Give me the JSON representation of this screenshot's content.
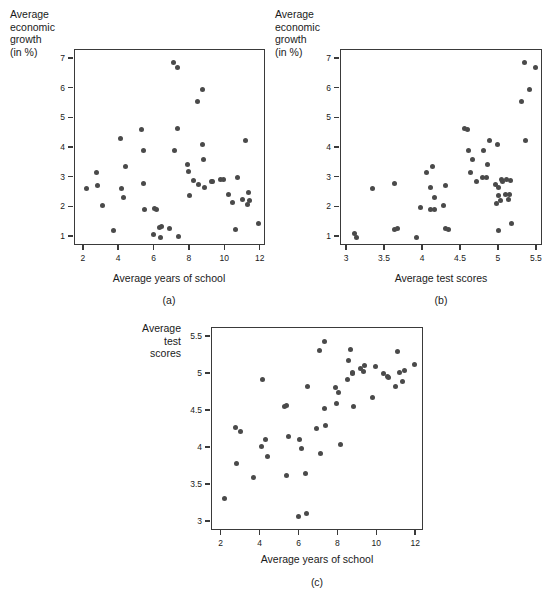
{
  "figure": {
    "panels": [
      {
        "id": "a",
        "caption": "(a)",
        "ylabel_lines": [
          "Average",
          "economic",
          "growth",
          "(in %)"
        ],
        "xlabel": "Average years of school",
        "xticks": [
          "2",
          "4",
          "6",
          "8",
          "10",
          "12"
        ],
        "yticks": [
          "1",
          "2",
          "3",
          "4",
          "5",
          "6",
          "7"
        ]
      },
      {
        "id": "b",
        "caption": "(b)",
        "ylabel_lines": [
          "Average",
          "economic",
          "growth",
          "(in %)"
        ],
        "xlabel": "Average test scores",
        "xticks": [
          "3",
          "3.5",
          "4",
          "4.5",
          "5",
          "5.5"
        ],
        "yticks": [
          "1",
          "2",
          "3",
          "4",
          "5",
          "6",
          "7"
        ]
      },
      {
        "id": "c",
        "caption": "(c)",
        "ylabel_lines": [
          "Average",
          "test",
          "scores"
        ],
        "xlabel": "Average years of school",
        "xticks": [
          "2",
          "4",
          "6",
          "8",
          "10",
          "12"
        ],
        "yticks": [
          "3",
          "3.5",
          "4",
          "4.5",
          "5",
          "5.5"
        ]
      }
    ],
    "marker_color": "#4a4a4a",
    "frame_color": "#3a3a3a"
  },
  "chart_data": [
    {
      "type": "scatter",
      "panel": "a",
      "title": "",
      "xlabel": "Average years of school",
      "ylabel": "Average economic growth (in %)",
      "xlim": [
        1.5,
        12.3
      ],
      "ylim": [
        0.7,
        7.3
      ],
      "xticks": [
        2,
        4,
        6,
        8,
        10,
        12
      ],
      "yticks": [
        1,
        2,
        3,
        4,
        5,
        6,
        7
      ],
      "grid": false,
      "legend": "none",
      "points": [
        [
          2.15,
          2.62
        ],
        [
          2.7,
          3.18
        ],
        [
          2.8,
          2.75
        ],
        [
          3.05,
          2.08
        ],
        [
          3.65,
          1.22
        ],
        [
          4.1,
          4.33
        ],
        [
          4.15,
          2.63
        ],
        [
          4.25,
          2.35
        ],
        [
          4.35,
          3.38
        ],
        [
          5.25,
          4.63
        ],
        [
          5.35,
          3.92
        ],
        [
          5.4,
          2.8
        ],
        [
          5.45,
          1.92
        ],
        [
          5.95,
          1.08
        ],
        [
          6.0,
          1.97
        ],
        [
          6.1,
          1.94
        ],
        [
          6.3,
          1.33
        ],
        [
          6.35,
          0.98
        ],
        [
          6.4,
          1.35
        ],
        [
          6.85,
          1.28
        ],
        [
          7.05,
          6.88
        ],
        [
          7.1,
          3.9
        ],
        [
          7.3,
          6.7
        ],
        [
          7.3,
          4.67
        ],
        [
          7.35,
          1.02
        ],
        [
          7.85,
          3.44
        ],
        [
          7.9,
          3.2
        ],
        [
          8.0,
          2.4
        ],
        [
          8.2,
          2.92
        ],
        [
          8.45,
          5.58
        ],
        [
          8.5,
          2.78
        ],
        [
          8.7,
          5.96
        ],
        [
          8.7,
          4.13
        ],
        [
          8.75,
          3.6
        ],
        [
          8.8,
          2.66
        ],
        [
          9.2,
          2.88
        ],
        [
          9.3,
          2.87
        ],
        [
          9.75,
          2.94
        ],
        [
          9.9,
          2.93
        ],
        [
          10.2,
          2.45
        ],
        [
          10.4,
          2.16
        ],
        [
          10.6,
          1.24
        ],
        [
          10.7,
          3.02
        ],
        [
          10.95,
          2.27
        ],
        [
          11.15,
          4.25
        ],
        [
          11.25,
          2.1
        ],
        [
          11.3,
          2.5
        ],
        [
          11.35,
          2.22
        ],
        [
          11.9,
          1.45
        ]
      ]
    },
    {
      "type": "scatter",
      "panel": "b",
      "title": "",
      "xlabel": "Average test scores",
      "ylabel": "Average economic growth (in %)",
      "xlim": [
        2.92,
        5.58
      ],
      "ylim": [
        0.7,
        7.3
      ],
      "xticks": [
        3,
        3.5,
        4,
        4.5,
        5,
        5.5
      ],
      "yticks": [
        1,
        2,
        3,
        4,
        5,
        6,
        7
      ],
      "grid": false,
      "legend": "none",
      "points": [
        [
          3.1,
          1.12
        ],
        [
          3.12,
          0.98
        ],
        [
          3.33,
          2.62
        ],
        [
          3.63,
          2.79
        ],
        [
          3.62,
          1.24
        ],
        [
          3.66,
          1.3
        ],
        [
          3.92,
          1.0
        ],
        [
          3.97,
          2.0
        ],
        [
          4.05,
          3.18
        ],
        [
          4.1,
          2.66
        ],
        [
          4.1,
          1.93
        ],
        [
          4.13,
          3.38
        ],
        [
          4.15,
          1.92
        ],
        [
          4.15,
          2.35
        ],
        [
          4.27,
          2.08
        ],
        [
          4.3,
          2.75
        ],
        [
          4.3,
          1.3
        ],
        [
          4.33,
          1.24
        ],
        [
          4.55,
          4.65
        ],
        [
          4.58,
          4.62
        ],
        [
          4.6,
          3.92
        ],
        [
          4.62,
          3.18
        ],
        [
          4.65,
          3.6
        ],
        [
          4.7,
          2.88
        ],
        [
          4.78,
          3.0
        ],
        [
          4.8,
          3.9
        ],
        [
          4.83,
          3.02
        ],
        [
          4.85,
          3.44
        ],
        [
          4.88,
          4.25
        ],
        [
          4.95,
          2.78
        ],
        [
          4.97,
          2.14
        ],
        [
          4.98,
          4.13
        ],
        [
          5.0,
          2.66
        ],
        [
          5.0,
          2.4
        ],
        [
          5.0,
          1.22
        ],
        [
          5.02,
          2.22
        ],
        [
          5.03,
          2.94
        ],
        [
          5.05,
          2.86
        ],
        [
          5.08,
          2.44
        ],
        [
          5.1,
          2.93
        ],
        [
          5.12,
          2.27
        ],
        [
          5.14,
          2.45
        ],
        [
          5.15,
          2.92
        ],
        [
          5.16,
          1.45
        ],
        [
          5.33,
          6.88
        ],
        [
          5.35,
          4.25
        ],
        [
          5.3,
          5.58
        ],
        [
          5.4,
          5.96
        ],
        [
          5.48,
          6.7
        ]
      ]
    },
    {
      "type": "scatter",
      "panel": "c",
      "title": "",
      "xlabel": "Average years of school",
      "ylabel": "Average test scores",
      "xlim": [
        1.5,
        12.4
      ],
      "ylim": [
        2.88,
        5.62
      ],
      "xticks": [
        2,
        4,
        6,
        8,
        10,
        12
      ],
      "yticks": [
        3,
        3.5,
        4,
        4.5,
        5,
        5.5
      ],
      "grid": false,
      "legend": "none",
      "points": [
        [
          2.15,
          3.32
        ],
        [
          2.7,
          4.28
        ],
        [
          2.75,
          3.79
        ],
        [
          2.95,
          4.22
        ],
        [
          3.65,
          3.6
        ],
        [
          4.05,
          4.02
        ],
        [
          4.1,
          4.93
        ],
        [
          4.25,
          4.12
        ],
        [
          4.35,
          3.88
        ],
        [
          5.25,
          4.56
        ],
        [
          5.32,
          4.57
        ],
        [
          5.35,
          3.63
        ],
        [
          5.45,
          4.15
        ],
        [
          5.95,
          3.08
        ],
        [
          6.0,
          4.11
        ],
        [
          6.1,
          4.0
        ],
        [
          6.3,
          3.65
        ],
        [
          6.35,
          3.12
        ],
        [
          6.4,
          4.83
        ],
        [
          6.85,
          4.26
        ],
        [
          7.05,
          5.32
        ],
        [
          7.1,
          3.92
        ],
        [
          7.3,
          5.44
        ],
        [
          7.3,
          4.54
        ],
        [
          7.35,
          4.3
        ],
        [
          7.85,
          4.82
        ],
        [
          7.9,
          4.6
        ],
        [
          8.0,
          4.75
        ],
        [
          8.1,
          4.05
        ],
        [
          8.45,
          4.93
        ],
        [
          8.5,
          5.18
        ],
        [
          8.6,
          5.33
        ],
        [
          8.7,
          5.0
        ],
        [
          8.72,
          5.02
        ],
        [
          8.8,
          4.56
        ],
        [
          9.15,
          5.08
        ],
        [
          9.3,
          5.03
        ],
        [
          9.35,
          5.12
        ],
        [
          9.75,
          4.68
        ],
        [
          9.9,
          5.1
        ],
        [
          10.3,
          5.0
        ],
        [
          10.5,
          4.97
        ],
        [
          10.6,
          4.95
        ],
        [
          10.95,
          4.83
        ],
        [
          11.05,
          5.3
        ],
        [
          11.15,
          5.02
        ],
        [
          11.3,
          4.9
        ],
        [
          11.4,
          5.05
        ],
        [
          11.9,
          5.13
        ]
      ]
    }
  ]
}
